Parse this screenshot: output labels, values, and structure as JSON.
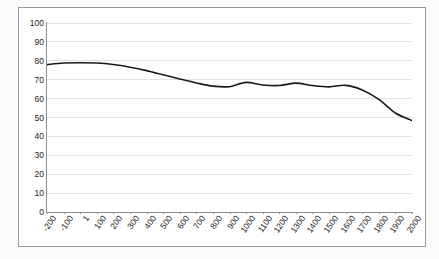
{
  "chart_data": {
    "type": "line",
    "title": "",
    "subtitle": "",
    "xlabel": "",
    "ylabel": "",
    "xlim": [
      -200,
      2000
    ],
    "ylim": [
      0,
      100
    ],
    "grid": true,
    "grid_axis": "y",
    "legend": false,
    "legend_position": "none",
    "line_color": "#1a1a1a",
    "grid_color": "#e2e2e2",
    "axis_color": "#8e8e8e",
    "frame_color": "#9a9a9a",
    "background_color": "#ffffff",
    "page_background_color": "#fbfbfa",
    "x_tick_labels": [
      "-200",
      "-100",
      "1",
      "100",
      "200",
      "300",
      "400",
      "500",
      "600",
      "700",
      "800",
      "900",
      "1000",
      "1100",
      "1200",
      "1300",
      "1400",
      "1500",
      "1600",
      "1700",
      "1800",
      "1900",
      "2000"
    ],
    "y_tick_labels": [
      "0",
      "10",
      "20",
      "30",
      "40",
      "50",
      "60",
      "70",
      "80",
      "90",
      "100"
    ],
    "y_ticks": [
      0,
      10,
      20,
      30,
      40,
      50,
      60,
      70,
      80,
      90,
      100
    ],
    "x": [
      -200,
      -100,
      0,
      100,
      200,
      300,
      400,
      500,
      600,
      700,
      800,
      900,
      1000,
      1100,
      1200,
      1300,
      1400,
      1500,
      1600,
      1700,
      1800,
      1900,
      2000
    ],
    "values": [
      78.0,
      78.8,
      79.0,
      78.8,
      78.0,
      76.6,
      74.8,
      72.6,
      70.4,
      68.3,
      66.6,
      66.3,
      68.6,
      67.2,
      66.9,
      68.2,
      66.9,
      66.2,
      67.0,
      64.6,
      59.6,
      52.4,
      48.4
    ],
    "series": [
      {
        "name": "series-1",
        "color": "#1a1a1a",
        "values": [
          78.0,
          78.8,
          79.0,
          78.8,
          78.0,
          76.6,
          74.8,
          72.6,
          70.4,
          68.3,
          66.6,
          66.3,
          68.6,
          67.2,
          66.9,
          68.2,
          66.9,
          66.2,
          67.0,
          64.6,
          59.6,
          52.4,
          48.4
        ]
      }
    ]
  }
}
